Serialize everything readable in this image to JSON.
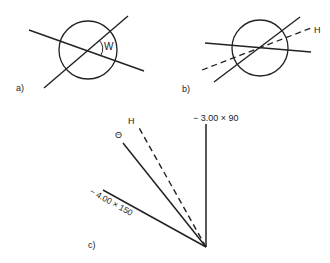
{
  "panels": {
    "a": {
      "label": "a)",
      "angle_label": "W"
    },
    "b": {
      "label": "b)",
      "axis_label": "H"
    },
    "c": {
      "label": "c)",
      "meridian_90_label": "− 3.00 × 90",
      "meridian_150_label": "− 4.00 × 150",
      "axis_label": "H",
      "theta_label": "Θ"
    }
  },
  "colors": {
    "stroke": "#222222",
    "background": "#ffffff"
  }
}
